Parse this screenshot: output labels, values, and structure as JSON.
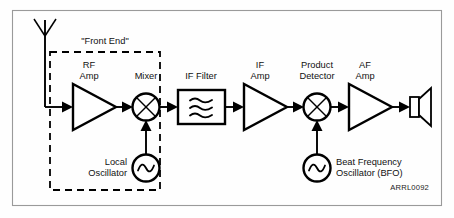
{
  "figure": {
    "credit": "ARRL0092",
    "front_end_label": "\"Front End\"",
    "background_color": "#fefefe",
    "line_color": "#000000",
    "frame_color": "#9a9a9a"
  },
  "blocks": {
    "antenna": {
      "label": "",
      "name": "antenna"
    },
    "rf_amp": {
      "label_line1": "RF",
      "label_line2": "Amp",
      "type": "amplifier"
    },
    "mixer": {
      "label": "Mixer",
      "type": "mixer"
    },
    "local_oscillator": {
      "label_line1": "Local",
      "label_line2": "Oscillator",
      "type": "oscillator"
    },
    "if_filter": {
      "label": "IF Filter",
      "type": "bandpass-filter"
    },
    "if_amp": {
      "label_line1": "IF",
      "label_line2": "Amp",
      "type": "amplifier"
    },
    "product_detector": {
      "label_line1": "Product",
      "label_line2": "Detector",
      "type": "mixer"
    },
    "bfo": {
      "label_line1": "Beat Frequency",
      "label_line2": "Oscillator (BFO)",
      "type": "oscillator"
    },
    "af_amp": {
      "label_line1": "AF",
      "label_line2": "Amp",
      "type": "amplifier"
    },
    "speaker": {
      "label": "",
      "type": "loudspeaker"
    }
  },
  "signal_chain": [
    "antenna",
    "rf_amp",
    "mixer",
    "if_filter",
    "if_amp",
    "product_detector",
    "af_amp",
    "speaker"
  ]
}
